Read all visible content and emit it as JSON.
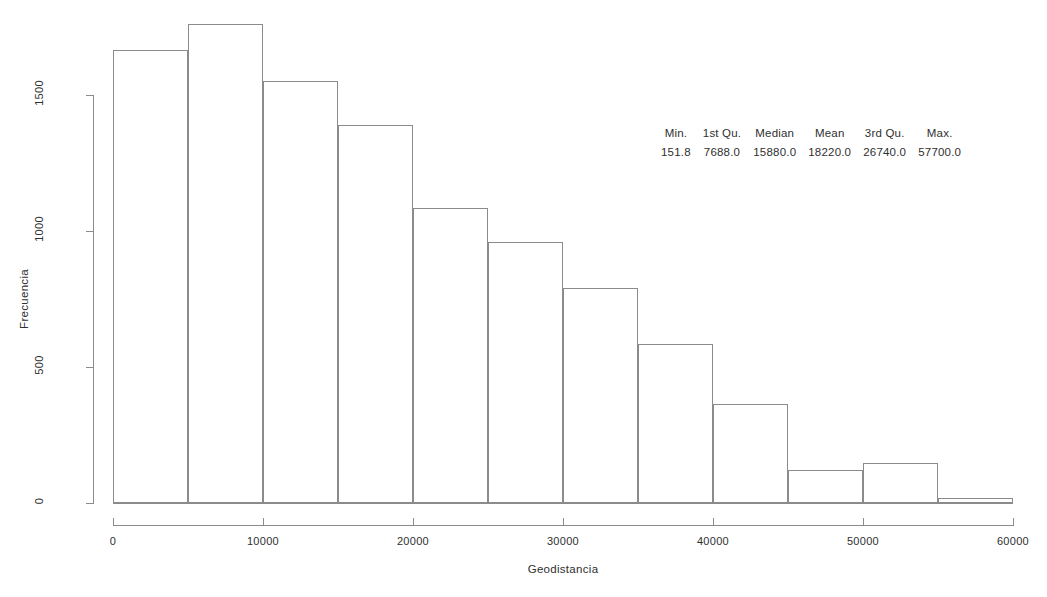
{
  "chart_data": {
    "type": "bar",
    "title": "",
    "xlabel": "Geodistancia",
    "ylabel": "Frecuencia",
    "xlim": [
      0,
      60000
    ],
    "ylim": [
      0,
      1500
    ],
    "grid": false,
    "legend": "none",
    "bin_width": 5000,
    "bin_edges": [
      0,
      5000,
      10000,
      15000,
      20000,
      25000,
      30000,
      35000,
      40000,
      45000,
      50000,
      55000,
      60000
    ],
    "categories": [
      "0-5000",
      "5000-10000",
      "10000-15000",
      "15000-20000",
      "20000-25000",
      "25000-30000",
      "30000-35000",
      "35000-40000",
      "40000-45000",
      "45000-50000",
      "50000-55000",
      "55000-60000"
    ],
    "values": [
      1665,
      1760,
      1550,
      1390,
      1085,
      960,
      790,
      585,
      365,
      120,
      148,
      20
    ],
    "xticks": [
      0,
      10000,
      20000,
      30000,
      40000,
      50000,
      60000
    ],
    "xtick_labels": [
      "0",
      "10000",
      "20000",
      "30000",
      "40000",
      "50000",
      "60000"
    ],
    "yticks": [
      0,
      500,
      1000,
      1500
    ],
    "ytick_labels": [
      "0",
      "500",
      "1000",
      "1500"
    ]
  },
  "summary": {
    "headers": [
      "Min.",
      "1st Qu.",
      "Median",
      "Mean",
      "3rd Qu.",
      "Max."
    ],
    "values": [
      "151.8",
      "7688.0",
      "15880.0",
      "18220.0",
      "26740.0",
      "57700.0"
    ]
  },
  "style": {
    "line_color": "#8b8b8b",
    "text_color": "#2f2f2f",
    "background": "#ffffff"
  }
}
